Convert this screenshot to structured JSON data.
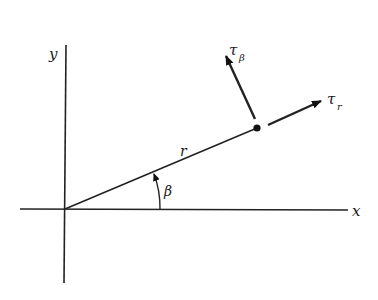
{
  "diagram": {
    "axes": {
      "x_label": "x",
      "y_label": "y"
    },
    "radius_label": "r",
    "angle_label": "β",
    "vectors": [
      {
        "name": "tau-beta",
        "symbol": "τ",
        "subscript": "β"
      },
      {
        "name": "tau-r",
        "symbol": "τ",
        "subscript": "r"
      }
    ],
    "colors": {
      "ink": "#222222",
      "background": "#ffffff"
    }
  }
}
